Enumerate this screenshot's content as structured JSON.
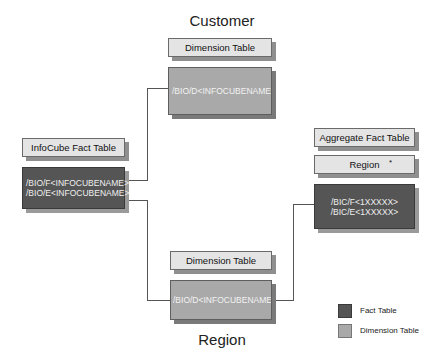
{
  "titles": {
    "top": "Customer",
    "bottom": "Region"
  },
  "customer_dimension": {
    "label": "Dimension Table",
    "table_name": "/BIO/D<INFOCUBENAME>1"
  },
  "infocube_fact": {
    "label": "InfoCube Fact Table",
    "table_names": [
      "/BIO/F<INFOCUBENAME>",
      "/BIO/E<INFOCUBENAME>"
    ]
  },
  "aggregate_fact": {
    "label": "Aggregate Fact Table",
    "characteristic": "Region",
    "marker": "*",
    "table_names": [
      "/BIC/F<1XXXXX>",
      "/BIC/E<1XXXXX>"
    ]
  },
  "region_dimension": {
    "label": "Dimension Table",
    "table_name": "/BIO/D<INFOCUBENAME>2"
  },
  "legend": {
    "items": [
      {
        "label": "Fact Table",
        "color": "#555555"
      },
      {
        "label": "Dimension Table",
        "color": "#a9a9a9"
      }
    ]
  },
  "colors": {
    "fact": "#555555",
    "dimension": "#a9a9a9",
    "label": "#e4e4e4"
  }
}
